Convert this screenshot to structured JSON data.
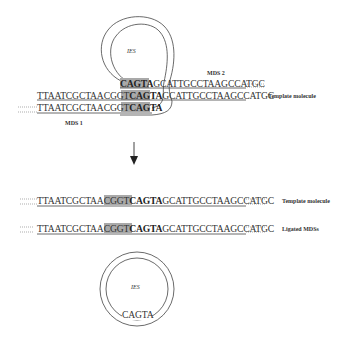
{
  "top_panel": {
    "ies_label": "IES",
    "mds1_label": "MDS 1",
    "mds2_label": "MDS 2",
    "template_label": "Template molecule",
    "strand_mds2": {
      "pointer": "CAGTA",
      "rest": "GCATTGCCTAAGCCATGC"
    },
    "strand_template": {
      "prefix": "TTAATCGCTAACGGT",
      "pointer": "CAGTA",
      "rest": "GCATTGCCTAAGCCATGC"
    },
    "strand_mds1": {
      "prefix": "TTAATCGCTAACGGT",
      "pointer": "CAGTA"
    }
  },
  "arrow": {
    "direction": "down"
  },
  "bottom_panel": {
    "template_row": {
      "prefix": "TTAATCGCTAACGGT",
      "pointer": "CAGTA",
      "rest": "GCATTGCCTAAGCCATGC",
      "label": "Template molecule"
    },
    "ligated_row": {
      "prefix": "TTAATCGCTAACGGT",
      "pointer": "CAGTA",
      "rest": "GCATTGCCTAAGCCATGC",
      "label": "Ligated MDSs"
    },
    "excised_circle": {
      "ies_label": "IES",
      "pointer": "CAGTA"
    }
  },
  "colors": {
    "pointer_highlight": "#a9a9a9",
    "line": "#444444",
    "text": "#333333"
  }
}
